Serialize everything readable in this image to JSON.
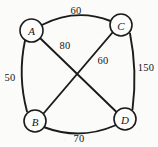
{
  "diagram": {
    "type": "undirected-weighted-graph",
    "background_color": "#fbfbfa",
    "stroke_color": "#1b1b1b",
    "nodes": [
      {
        "id": "A",
        "label": "A",
        "cx": 31.5,
        "cy": 30.5,
        "r": 11.5
      },
      {
        "id": "C",
        "label": "C",
        "cx": 121.0,
        "cy": 25.0,
        "r": 11.0
      },
      {
        "id": "B",
        "label": "B",
        "cx": 35.0,
        "cy": 121.0,
        "r": 11.0
      },
      {
        "id": "D",
        "label": "D",
        "cx": 125.0,
        "cy": 119.0,
        "r": 11.0
      }
    ],
    "edges": [
      {
        "id": "edge-a-c",
        "from": "A",
        "to": "C",
        "weight": "60",
        "shape": "arc-outward-top",
        "label_x": 76,
        "label_y": 10
      },
      {
        "id": "edge-a-b",
        "from": "A",
        "to": "B",
        "weight": "50",
        "shape": "arc-outward-left",
        "label_x": 10,
        "label_y": 77
      },
      {
        "id": "edge-c-d",
        "from": "C",
        "to": "D",
        "weight": "150",
        "shape": "arc-outward-right",
        "label_x": 146,
        "label_y": 67
      },
      {
        "id": "edge-b-d",
        "from": "B",
        "to": "D",
        "weight": "70",
        "shape": "arc-outward-bottom",
        "label_x": 79,
        "label_y": 138
      },
      {
        "id": "edge-a-d",
        "from": "A",
        "to": "D",
        "weight": "80",
        "shape": "straight",
        "label_x": 65,
        "label_y": 45
      },
      {
        "id": "edge-c-b",
        "from": "C",
        "to": "B",
        "weight": "60",
        "shape": "straight",
        "label_x": 103,
        "label_y": 60
      }
    ]
  }
}
